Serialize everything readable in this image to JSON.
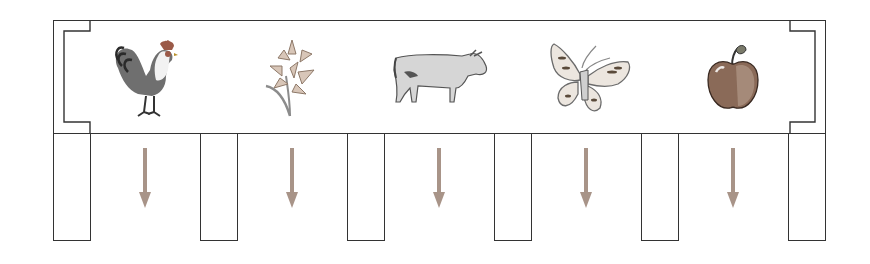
{
  "diagram": {
    "title": "",
    "items": [
      {
        "name": "rooster",
        "label": ""
      },
      {
        "name": "lily",
        "label": ""
      },
      {
        "name": "cow",
        "label": ""
      },
      {
        "name": "butterfly",
        "label": ""
      },
      {
        "name": "apple",
        "label": ""
      }
    ],
    "arrow_color": "#a89488",
    "line_color": "#333333"
  }
}
